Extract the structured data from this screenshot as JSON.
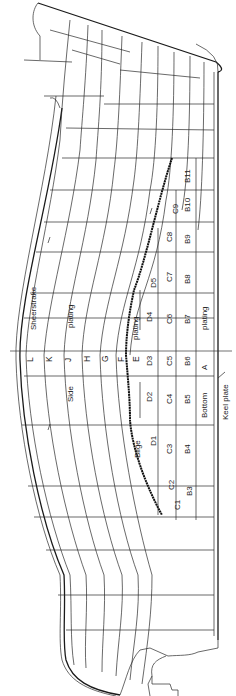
{
  "figure": {
    "orientation": "rotated 90° (bow at top, stern at bottom, keel at right)"
  },
  "strakes": {
    "side": [
      "L",
      "K",
      "J",
      "H",
      "G",
      "F",
      "E"
    ],
    "sheerstrake_label": "Sheerstrake",
    "side_label": "Side",
    "side_plating_label": "plating",
    "bilge_label": "Bilge",
    "bilge_plating_label": "plating",
    "bottom_label": "Bottom",
    "bottom_plating_label": "plating",
    "keel_label": "Keel plate",
    "keel_strake": "A"
  },
  "plates": {
    "D": [
      "D1",
      "D2",
      "D3",
      "D4",
      "D5"
    ],
    "C": [
      "C1",
      "C2",
      "C3",
      "C4",
      "C5",
      "C6",
      "C7",
      "C8",
      "C9"
    ],
    "B": [
      "B3",
      "B4",
      "B5",
      "B6",
      "B7",
      "B8",
      "B9",
      "B10",
      "B11"
    ]
  },
  "colors": {
    "line": "#2a2a2a",
    "background": "#ffffff"
  }
}
